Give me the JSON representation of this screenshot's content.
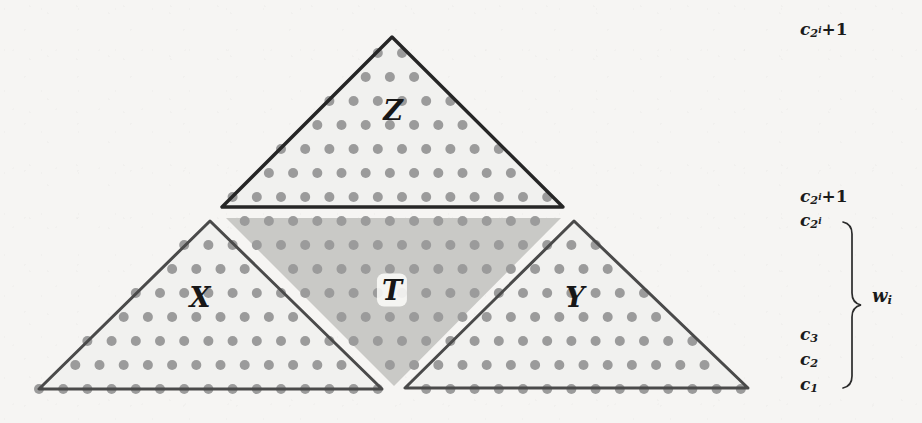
{
  "figure": {
    "type": "geometric-diagram",
    "background_color": "#f6f5f3",
    "ink_color": "#2b2b2b",
    "dot_color": "#9a9a9a",
    "shade_light": "#f1f1ef",
    "shade_dark": "#c9c9c6"
  },
  "triangles": [
    {
      "id": "Z",
      "label": "Z",
      "label_x": 393,
      "label_y": 110,
      "boxed": false,
      "apex": [
        392,
        37
      ],
      "left": [
        222,
        207
      ],
      "right": [
        563,
        207
      ],
      "edge_color": "#262626",
      "edge_width": 3.4
    },
    {
      "id": "X",
      "label": "X",
      "label_x": 200,
      "label_y": 297,
      "boxed": false,
      "apex": [
        210,
        221
      ],
      "left": [
        39,
        389
      ],
      "right": [
        382,
        389
      ],
      "edge_color": "#4a4a4a",
      "edge_width": 3.0
    },
    {
      "id": "Y",
      "label": "Y",
      "label_x": 575,
      "label_y": 297,
      "boxed": false,
      "apex": [
        574,
        221
      ],
      "left": [
        405,
        388
      ],
      "right": [
        748,
        388
      ],
      "edge_color": "#4a4a4a",
      "edge_width": 3.0
    }
  ],
  "shaded_region": {
    "id": "T",
    "label": "T",
    "label_x": 392,
    "label_y": 290,
    "boxed": true,
    "vertices": [
      [
        226,
        218
      ],
      [
        561,
        218
      ],
      [
        394,
        386
      ]
    ],
    "fill": "#c9c9c6"
  },
  "dot_grid": {
    "spacing_x": 24.2,
    "spacing_y": 24.0,
    "origin_x": 39,
    "origin_y": 389,
    "radius": 5.0,
    "color": "#9b9b9b",
    "rows": 16
  },
  "side_labels": [
    {
      "id": "c-2i-plus-1-top",
      "x": 800,
      "y": 30,
      "base": "c",
      "sub": "2",
      "sup": "i",
      "suffix": "+1"
    },
    {
      "id": "c-2i-plus-1-mid",
      "x": 800,
      "y": 197,
      "base": "c",
      "sub": "2",
      "sup": "i",
      "suffix": "+1"
    },
    {
      "id": "c-2i",
      "x": 800,
      "y": 221,
      "base": "c",
      "sub": "2",
      "sup": "i",
      "suffix": ""
    },
    {
      "id": "c-3",
      "x": 800,
      "y": 335,
      "base": "c",
      "sub": "3",
      "sup": "",
      "suffix": ""
    },
    {
      "id": "c-2",
      "x": 800,
      "y": 360,
      "base": "c",
      "sub": "2",
      "sup": "",
      "suffix": ""
    },
    {
      "id": "c-1",
      "x": 800,
      "y": 385,
      "base": "c",
      "sub": "1",
      "sup": "",
      "suffix": ""
    }
  ],
  "brace": {
    "id": "w-brace",
    "x": 852,
    "top_y": 222,
    "bottom_y": 388,
    "label": "w",
    "label_sub": "i",
    "label_x": 872,
    "label_y": 297,
    "color": "#2b2b2b"
  }
}
